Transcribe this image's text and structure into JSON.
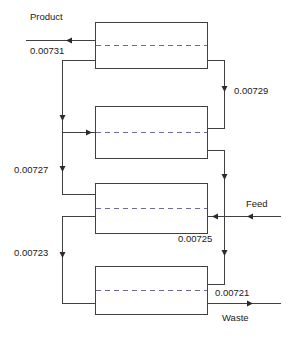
{
  "diagram": {
    "stroke_color": "#404040",
    "dash_color": "#6b6b9c",
    "text_color": "#1a1a1a",
    "stages": [
      {
        "name": "stage-1"
      },
      {
        "name": "stage-2"
      },
      {
        "name": "stage-3"
      },
      {
        "name": "stage-4"
      }
    ],
    "labels": {
      "product": "Product",
      "product_value": "0.00731",
      "value_right_top": "0.00729",
      "value_left_mid": "0.00727",
      "value_mid_bottom": "0.00725",
      "value_left_low": "0.00723",
      "value_right_low": "0.00721",
      "feed": "Feed",
      "waste": "Waste"
    }
  }
}
